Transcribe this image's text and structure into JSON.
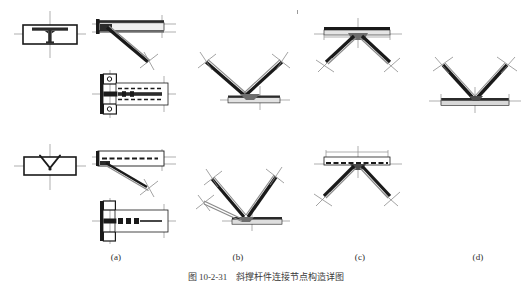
{
  "figure": {
    "caption": "图 10-2-31　斜撑杆件连接节点构造详图",
    "column_labels": [
      {
        "id": "a",
        "text": "(a)"
      },
      {
        "id": "b",
        "text": "(b)"
      },
      {
        "id": "c",
        "text": "(c)"
      },
      {
        "id": "d",
        "text": "(d)"
      }
    ],
    "panels": [
      {
        "id": "panel-a-top-symbol",
        "name": "tee-joint-section-symbol",
        "description": "矩形框内 T 形（工字形）断面焊接符号，带十字中心线"
      },
      {
        "id": "panel-a-top-elevation",
        "name": "single-brace-elevation",
        "description": "梁翼缘与单根斜撑杆连接立面图，带中心线与端部标记"
      },
      {
        "id": "panel-a-mid-plan",
        "name": "gusset-plate-plan",
        "description": "节点板平面图，带螺栓排列虚线与加劲肋"
      },
      {
        "id": "panel-a-bottom-symbol",
        "name": "vee-groove-weld-symbol",
        "description": "矩形框内 V 形坡口焊缝符号，带十字中心线"
      },
      {
        "id": "panel-a-bottom-elevation",
        "name": "single-brace-elevation-alt",
        "description": "梁与单根斜撑杆连接立面图（另一种构造）"
      },
      {
        "id": "panel-a-bottom-plan",
        "name": "gusset-plate-plan-alt",
        "description": "节点板平面图（另一种构造），带螺栓与加劲肋"
      },
      {
        "id": "panel-b-top",
        "name": "vee-brace-below-beam",
        "description": "两根斜撑杆于梁下汇交成 V 形（人字撑）节点"
      },
      {
        "id": "panel-b-bottom",
        "name": "vee-brace-below-beam-double",
        "description": "两根斜撑杆于梁下汇交，含双重连接板构造"
      },
      {
        "id": "panel-c-top",
        "name": "inverted-vee-brace-under-beam",
        "description": "两根斜撑杆自梁下向外张开的倒 V 形节点"
      },
      {
        "id": "panel-c-bottom",
        "name": "inverted-vee-brace-under-beam-alt",
        "description": "两根斜撑杆自梁下向外张开的倒 V 形节点（另一构造）"
      },
      {
        "id": "panel-d-top",
        "name": "vee-brace-above-beam",
        "description": "两根斜撑杆于梁上汇交成 V 形节点"
      }
    ]
  },
  "colors": {
    "line": "#1a1a1a",
    "member_fill": "#cfcfcf",
    "dark_fill": "#2b2b2b",
    "centerline": "#8c8c8c",
    "background": "#ffffff"
  }
}
